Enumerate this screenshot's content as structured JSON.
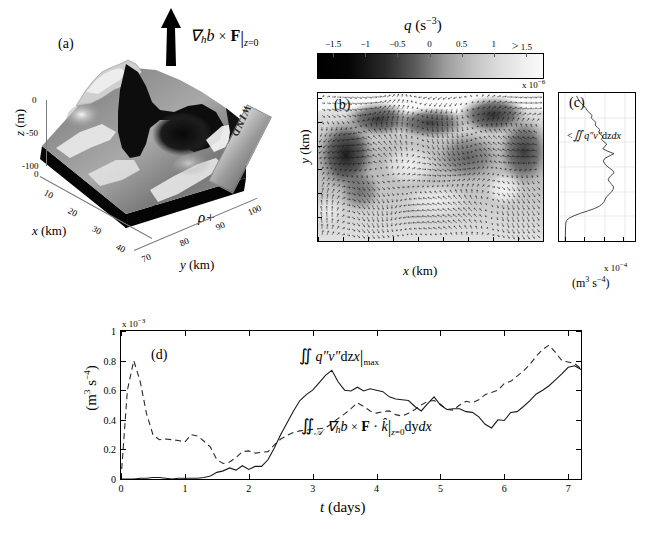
{
  "figure": {
    "panels": [
      "(a)",
      "(b)",
      "(c)",
      "(d)"
    ]
  },
  "panel_a": {
    "id": "(a)",
    "xlabel": "x (km)",
    "ylabel": "y (km)",
    "zlabel": "z (m)",
    "xticks": [
      "0",
      "10",
      "20",
      "30",
      "40"
    ],
    "yticks": [
      "70",
      "80",
      "90",
      "100"
    ],
    "zticks": [
      "0",
      "-50",
      "-100"
    ],
    "arrow_label": "∇ₕb × F|_{z=0}",
    "arrow_label_parts": {
      "nabla": "∇",
      "h": "h",
      "b": "b",
      "times": "×",
      "F": "F",
      "bar_sub": "z=0"
    },
    "wind_label": "WIND",
    "density_low_label": "ρ−",
    "density_high_label": "ρ+",
    "surface_colormap": "grayscale"
  },
  "colorbar": {
    "title": "q (s⁻³)",
    "title_symbol": "q",
    "title_units": "(s",
    "title_units_exp": "−3",
    "title_units_close": ")",
    "ticks": [
      "−1.5",
      "−1",
      "−0.5",
      "0",
      "0.5",
      "1",
      "1.5"
    ],
    "tick_values": [
      -1.5,
      -1,
      -0.5,
      0,
      0.5,
      1,
      1.5
    ],
    "last_tick_prefix": ">",
    "exponent": "x 10",
    "exponent_power": "−6",
    "cmap_low_color": "#000000",
    "cmap_high_color": "#ffffff"
  },
  "panel_b": {
    "id": "(b)",
    "xlabel": "x (km)",
    "ylabel": "y (km)",
    "xticks": [
      "0",
      "5",
      "10",
      "15",
      "20",
      "25",
      "30",
      "35",
      "40"
    ],
    "xtick_values": [
      0,
      5,
      10,
      15,
      20,
      25,
      30,
      35,
      40
    ],
    "yticks": [
      "70",
      "75",
      "80",
      "85",
      "90",
      "95",
      "100"
    ],
    "ytick_values": [
      70,
      75,
      80,
      85,
      90,
      95,
      100
    ],
    "xlim": [
      0,
      45
    ],
    "ylim": [
      70,
      101
    ],
    "overlay": "velocity-vector-quiver"
  },
  "panel_c": {
    "id": "(c)",
    "curve_label": "∬ q″v″dzdx",
    "curve_label_prefix": "<",
    "xticks": [
      "0",
      "2",
      "4",
      "6"
    ],
    "xtick_values": [
      0,
      2,
      4,
      6
    ],
    "xlim": [
      -0.6,
      7.2
    ],
    "ylim": [
      70,
      101
    ],
    "exponent": "x 10",
    "exponent_power": "−4",
    "units": "(m³ s⁻⁴)",
    "profile": {
      "y": [
        70.2,
        71.5,
        72.5,
        73.2,
        73.8,
        74.3,
        74.8,
        75.3,
        75.8,
        76.3,
        76.8,
        77.3,
        77.8,
        78.3,
        78.8,
        79.3,
        79.8,
        80.3,
        80.8,
        81.3,
        81.8,
        82.3,
        82.8,
        83.3,
        83.8,
        84.3,
        84.8,
        85.3,
        85.8,
        86.3,
        86.8,
        87.3,
        87.8,
        88.3,
        88.8,
        89.3,
        89.8,
        90.3,
        90.8,
        91.3,
        91.8,
        92.3,
        92.8,
        93.3,
        93.8,
        94.3,
        94.8,
        95.3,
        95.8,
        96.3,
        96.8,
        97.3,
        97.8,
        98.3,
        98.8,
        99.3,
        99.8,
        100.4
      ],
      "x": [
        0.05,
        0.06,
        0.07,
        0.08,
        0.1,
        0.18,
        0.45,
        0.95,
        1.6,
        2.35,
        3.05,
        3.55,
        3.85,
        4.05,
        4.15,
        4.3,
        4.55,
        4.8,
        4.95,
        5.0,
        4.85,
        4.6,
        4.45,
        4.55,
        4.8,
        5.05,
        4.9,
        4.55,
        4.25,
        4.05,
        3.95,
        4.1,
        4.55,
        5.05,
        4.4,
        3.9,
        4.1,
        4.3,
        4.0,
        3.75,
        3.9,
        3.7,
        3.45,
        3.6,
        3.35,
        3.1,
        3.2,
        2.95,
        2.7,
        2.8,
        2.55,
        2.3,
        2.15,
        1.95,
        1.7,
        1.5,
        1.35,
        1.2
      ]
    }
  },
  "panel_d": {
    "id": "(d)",
    "xlabel": "t (days)",
    "ylabel": "(m³ s⁻⁴)",
    "exponent": "x 10",
    "exponent_power": "−3",
    "xticks": [
      "0",
      "1",
      "2",
      "3",
      "4",
      "5",
      "6",
      "7"
    ],
    "xtick_values": [
      0,
      1,
      2,
      3,
      4,
      5,
      6,
      7
    ],
    "yticks": [
      "0",
      "0.2",
      "0.4",
      "0.6",
      "0.8",
      "1"
    ],
    "ytick_values": [
      0,
      0.2,
      0.4,
      0.6,
      0.8,
      1
    ],
    "xlim": [
      0,
      7.2
    ],
    "ylim": [
      0,
      1
    ],
    "annotation_solid": "∬ q″v″dzdx|max",
    "annotation_dashed": "∬_𝒜 ∇ₕb × F · k̂|_{z=0} dydx"
  },
  "chart_data": [
    {
      "type": "line",
      "title": "(d)",
      "xlabel": "t (days)",
      "ylabel": "(m³ s⁻⁴)  x 10⁻³",
      "xlim": [
        0,
        7.2
      ],
      "ylim": [
        0,
        1
      ],
      "grid": false,
      "legend": "inline-annotations",
      "series": [
        {
          "name": "∬ q″v″dzdx|max",
          "style": "solid",
          "x": [
            0.0,
            0.1,
            0.2,
            0.3,
            0.4,
            0.5,
            0.6,
            0.7,
            0.8,
            0.9,
            1.0,
            1.1,
            1.2,
            1.3,
            1.4,
            1.5,
            1.6,
            1.7,
            1.8,
            1.9,
            2.0,
            2.1,
            2.2,
            2.3,
            2.4,
            2.5,
            2.6,
            2.7,
            2.8,
            2.9,
            3.0,
            3.1,
            3.2,
            3.3,
            3.4,
            3.5,
            3.6,
            3.7,
            3.8,
            3.9,
            4.0,
            4.1,
            4.2,
            4.3,
            4.4,
            4.5,
            4.6,
            4.7,
            4.8,
            4.9,
            5.0,
            5.1,
            5.2,
            5.3,
            5.4,
            5.5,
            5.6,
            5.7,
            5.8,
            5.9,
            6.0,
            6.1,
            6.2,
            6.3,
            6.4,
            6.5,
            6.6,
            6.7,
            6.8,
            6.9,
            7.0,
            7.1,
            7.2
          ],
          "y": [
            0.0,
            0.0,
            0.0,
            0.005,
            0.005,
            0.01,
            0.01,
            0.005,
            0.0,
            0.005,
            0.005,
            0.005,
            0.005,
            0.01,
            0.02,
            0.045,
            0.055,
            0.075,
            0.06,
            0.09,
            0.065,
            0.085,
            0.085,
            0.13,
            0.21,
            0.3,
            0.38,
            0.46,
            0.53,
            0.57,
            0.6,
            0.65,
            0.7,
            0.735,
            0.655,
            0.6,
            0.595,
            0.62,
            0.595,
            0.61,
            0.6,
            0.59,
            0.555,
            0.54,
            0.535,
            0.53,
            0.49,
            0.46,
            0.51,
            0.555,
            0.5,
            0.47,
            0.475,
            0.475,
            0.455,
            0.45,
            0.42,
            0.37,
            0.345,
            0.4,
            0.395,
            0.45,
            0.455,
            0.49,
            0.53,
            0.575,
            0.6,
            0.63,
            0.67,
            0.71,
            0.755,
            0.765,
            0.74
          ]
        },
        {
          "name": "∬_𝒜 ∇ₕb × F · k̂|_{z=0} dydx",
          "style": "dashed",
          "x": [
            0.0,
            0.1,
            0.2,
            0.3,
            0.4,
            0.5,
            0.6,
            0.7,
            0.8,
            0.9,
            1.0,
            1.1,
            1.2,
            1.3,
            1.4,
            1.5,
            1.6,
            1.7,
            1.8,
            1.9,
            2.0,
            2.1,
            2.2,
            2.3,
            2.4,
            2.5,
            2.6,
            2.7,
            2.8,
            2.9,
            3.0,
            3.1,
            3.2,
            3.3,
            3.4,
            3.5,
            3.6,
            3.7,
            3.8,
            3.9,
            4.0,
            4.1,
            4.2,
            4.3,
            4.4,
            4.5,
            4.6,
            4.7,
            4.8,
            4.9,
            5.0,
            5.1,
            5.2,
            5.3,
            5.4,
            5.5,
            5.6,
            5.7,
            5.8,
            5.9,
            6.0,
            6.1,
            6.2,
            6.3,
            6.4,
            6.5,
            6.6,
            6.7,
            6.8,
            6.9,
            7.0,
            7.1,
            7.2
          ],
          "y": [
            0.0,
            0.6,
            0.8,
            0.66,
            0.44,
            0.3,
            0.265,
            0.27,
            0.265,
            0.26,
            0.25,
            0.3,
            0.29,
            0.255,
            0.215,
            0.13,
            0.105,
            0.115,
            0.145,
            0.185,
            0.19,
            0.175,
            0.18,
            0.185,
            0.23,
            0.27,
            0.295,
            0.315,
            0.325,
            0.33,
            0.335,
            0.34,
            0.345,
            0.375,
            0.41,
            0.44,
            0.475,
            0.515,
            0.49,
            0.46,
            0.445,
            0.455,
            0.46,
            0.435,
            0.425,
            0.445,
            0.47,
            0.5,
            0.525,
            0.53,
            0.505,
            0.47,
            0.465,
            0.5,
            0.525,
            0.515,
            0.535,
            0.57,
            0.585,
            0.6,
            0.645,
            0.66,
            0.695,
            0.73,
            0.775,
            0.83,
            0.875,
            0.905,
            0.855,
            0.8,
            0.79,
            0.78,
            0.745
          ]
        }
      ]
    },
    {
      "type": "line",
      "title": "(c)",
      "xlabel": "(m³ s⁻⁴)  x 10⁻⁴",
      "ylabel": "y (km)",
      "orientation": "horizontal-profile",
      "xlim": [
        -0.6,
        7.2
      ],
      "ylim": [
        70,
        101
      ],
      "grid": true,
      "series": [
        {
          "name": "∬ q″v″dzdx",
          "style": "solid"
        }
      ]
    }
  ]
}
